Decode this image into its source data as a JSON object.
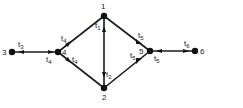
{
  "diagram": {
    "nodes": [
      {
        "id": "1",
        "label": "1",
        "x": 104,
        "y": 16
      },
      {
        "id": "2",
        "label": "2",
        "x": 104,
        "y": 88
      },
      {
        "id": "3",
        "label": "3",
        "x": 12,
        "y": 52
      },
      {
        "id": "4",
        "label": "4",
        "x": 58,
        "y": 52
      },
      {
        "id": "5",
        "label": "5",
        "x": 150,
        "y": 51
      },
      {
        "id": "6",
        "label": "6",
        "x": 195,
        "y": 51
      }
    ],
    "edges": [
      {
        "from": "3",
        "to": "4",
        "labels": [
          "t3",
          "t4"
        ]
      },
      {
        "from": "4",
        "to": "1",
        "labels": [
          "t4"
        ]
      },
      {
        "from": "4",
        "to": "2",
        "labels": [
          "t4"
        ]
      },
      {
        "from": "1",
        "to": "2",
        "labels": [
          "t1",
          "t2"
        ]
      },
      {
        "from": "1",
        "to": "5",
        "labels": [
          "t5"
        ]
      },
      {
        "from": "2",
        "to": "5",
        "labels": [
          "t5"
        ]
      },
      {
        "from": "5",
        "to": "6",
        "labels": [
          "t5",
          "t6"
        ]
      }
    ],
    "edge_labels": {
      "t3": {
        "base": "t",
        "sub": "3"
      },
      "t4a": {
        "base": "t",
        "sub": "4"
      },
      "t4b": {
        "base": "t",
        "sub": "4"
      },
      "t4c": {
        "base": "t",
        "sub": "4"
      },
      "t1": {
        "base": "t",
        "sub": "1"
      },
      "t2": {
        "base": "t",
        "sub": "2"
      },
      "t5a": {
        "base": "t",
        "sub": "5"
      },
      "t5b": {
        "base": "t",
        "sub": "5"
      },
      "t5c": {
        "base": "t",
        "sub": "5"
      },
      "t6": {
        "base": "t",
        "sub": "6"
      }
    }
  }
}
